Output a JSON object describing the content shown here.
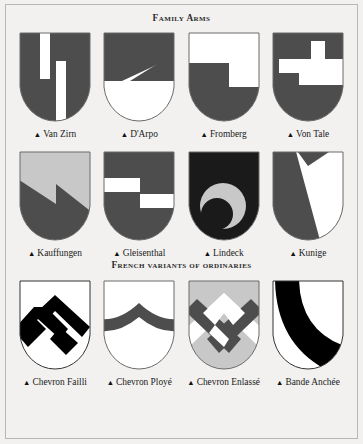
{
  "page": {
    "background": "#f2f1ef",
    "border_color": "#b9b7b3",
    "bullet": "▲"
  },
  "palette": {
    "dark_gray": "#4d4d4d",
    "light_gray": "#c8c8c8",
    "near_black": "#1a1a1a",
    "black": "#000000",
    "white": "#ffffff",
    "outline": "#6b6b6b",
    "outline_dark": "#333333"
  },
  "sections": [
    {
      "id": "family-arms",
      "title": "Family Arms",
      "shields": [
        {
          "name": "Van Zirn",
          "field": "#4d4d4d",
          "charge": "#ffffff",
          "outline": "#6b6b6b",
          "pattern": "two-pallets-offset",
          "blazon_note": "Dark field with two offset white vertical bars"
        },
        {
          "name": "D'Arpo",
          "field": "#ffffff",
          "charge": "#4d4d4d",
          "outline": "#6b6b6b",
          "pattern": "z-bend",
          "blazon_note": "White field with a dark Z-shaped chief and bend"
        },
        {
          "name": "Fromberg",
          "field": "#ffffff",
          "charge": "#4d4d4d",
          "outline": "#6b6b6b",
          "pattern": "stepped-party-per-fess",
          "blazon_note": "White above, dark below, divided by a stepped line"
        },
        {
          "name": "Von Tale",
          "field": "#4d4d4d",
          "charge": "#ffffff",
          "outline": "#6b6b6b",
          "pattern": "interlocked-key",
          "blazon_note": "Dark field with white interlocking key/spiral"
        }
      ]
    },
    {
      "id": "family-arms-2",
      "title": "",
      "shields": [
        {
          "name": "Kauffungen",
          "field": "#c8c8c8",
          "charge": "#4d4d4d",
          "outline": "#6b6b6b",
          "pattern": "zigzag-per-bend",
          "blazon_note": "Light gray above, dark gray below, zigzag division"
        },
        {
          "name": "Gleisenthal",
          "field": "#4d4d4d",
          "charge": "#ffffff",
          "outline": "#6b6b6b",
          "pattern": "two-offset-bars",
          "blazon_note": "Dark field with two offset white horizontal bars"
        },
        {
          "name": "Lindeck",
          "field": "#1a1a1a",
          "charge": "#c8c8c8",
          "outline": "#6b6b6b",
          "pattern": "crescent",
          "blazon_note": "Near-black field with a light gray crescent"
        },
        {
          "name": "Kunige",
          "field": "#4d4d4d",
          "charge": "#ffffff",
          "outline": "#6b6b6b",
          "pattern": "pile-chevron-white",
          "blazon_note": "Dark field with a white wedge issuing from chief"
        }
      ]
    },
    {
      "id": "french-variants",
      "title": "French variants of ordinaries",
      "shields": [
        {
          "name": "Chevron Failli",
          "field": "#ffffff",
          "charge": "#000000",
          "outline": "#333333",
          "pattern": "chevron-failli",
          "blazon_note": "Black chevron broken and displaced"
        },
        {
          "name": "Chevron Ployé",
          "field": "#ffffff",
          "charge": "#4d4d4d",
          "outline": "#6b6b6b",
          "pattern": "chevron-ploye",
          "blazon_note": "Dark arched chevron bowed across the field"
        },
        {
          "name": "Chevron Enlassé",
          "field": "#c8c8c8",
          "charge": "#ffffff",
          "charge2": "#4d4d4d",
          "outline": "#6b6b6b",
          "pattern": "chevron-enlasse",
          "blazon_note": "Light gray field with interlaced white and dark chevrons"
        },
        {
          "name": "Bande Anchée",
          "field": "#ffffff",
          "charge": "#000000",
          "outline": "#333333",
          "pattern": "bande-anchee",
          "blazon_note": "Black curved bend across a white field"
        }
      ]
    }
  ]
}
